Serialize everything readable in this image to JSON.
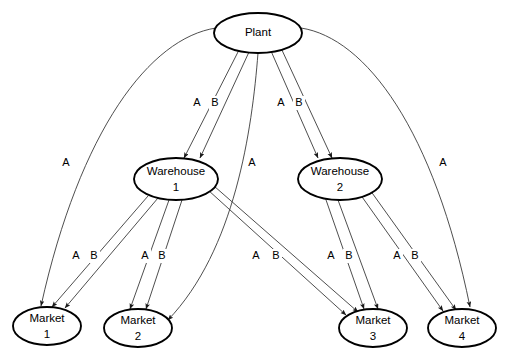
{
  "diagram": {
    "background_color": "#ffffff",
    "node_stroke_color": "#000000",
    "edge_stroke_color": "#3a3a3a",
    "label_color": "#000000"
  },
  "nodes": [
    {
      "id": "plant",
      "line1": "Plant",
      "line2": "",
      "cx": 258,
      "cy": 33,
      "rx": 44,
      "ry": 20
    },
    {
      "id": "warehouse1",
      "line1": "Warehouse",
      "line2": "1",
      "cx": 176,
      "cy": 179,
      "rx": 42,
      "ry": 21
    },
    {
      "id": "warehouse2",
      "line1": "Warehouse",
      "line2": "2",
      "cx": 340,
      "cy": 179,
      "rx": 42,
      "ry": 21
    },
    {
      "id": "market1",
      "line1": "Market",
      "line2": "1",
      "cx": 47,
      "cy": 326,
      "rx": 34,
      "ry": 19
    },
    {
      "id": "market2",
      "line1": "Market",
      "line2": "2",
      "cx": 138,
      "cy": 328,
      "rx": 34,
      "ry": 19
    },
    {
      "id": "market3",
      "line1": "Market",
      "line2": "3",
      "cx": 373,
      "cy": 328,
      "rx": 34,
      "ry": 19
    },
    {
      "id": "market4",
      "line1": "Market",
      "line2": "4",
      "cx": 462,
      "cy": 328,
      "rx": 34,
      "ry": 19
    }
  ],
  "edges": [
    {
      "id": "plant-market1-A",
      "from": "plant",
      "to": "market1",
      "commodity": "A",
      "label_x": 66,
      "label_y": 163,
      "path": "M 216 28 C 150 38 80 130 41 306"
    },
    {
      "id": "plant-warehouse1-A",
      "from": "plant",
      "to": "warehouse1",
      "commodity": "A",
      "label_x": 197,
      "label_y": 103,
      "path": "M 239 50 L 184 158"
    },
    {
      "id": "plant-warehouse1-B",
      "from": "plant",
      "to": "warehouse1",
      "commodity": "B",
      "label_x": 215,
      "label_y": 103,
      "path": "M 249 52 L 200 158"
    },
    {
      "id": "plant-market2-A",
      "from": "plant",
      "to": "market2",
      "commodity": "A",
      "label_x": 252,
      "label_y": 163,
      "path": "M 258 53 C 252 130 235 250 168 320"
    },
    {
      "id": "plant-warehouse2-A",
      "from": "plant",
      "to": "warehouse2",
      "commodity": "A",
      "label_x": 281,
      "label_y": 103,
      "path": "M 271 51 L 318 158"
    },
    {
      "id": "plant-warehouse2-B",
      "from": "plant",
      "to": "warehouse2",
      "commodity": "B",
      "label_x": 299,
      "label_y": 103,
      "path": "M 281 48 L 332 158"
    },
    {
      "id": "plant-market4-A",
      "from": "plant",
      "to": "market4",
      "commodity": "A",
      "label_x": 443,
      "label_y": 163,
      "path": "M 301 28 C 366 38 434 130 470 307"
    },
    {
      "id": "warehouse1-market1-A",
      "from": "warehouse1",
      "to": "market1",
      "commodity": "A",
      "label_x": 76,
      "label_y": 256,
      "path": "M 148 196 L 52 307"
    },
    {
      "id": "warehouse1-market1-B",
      "from": "warehouse1",
      "to": "market1",
      "commodity": "B",
      "label_x": 94,
      "label_y": 256,
      "path": "M 158 198 L 65 308"
    },
    {
      "id": "warehouse1-market2-A",
      "from": "warehouse1",
      "to": "market2",
      "commodity": "A",
      "label_x": 145,
      "label_y": 256,
      "path": "M 169 200 L 130 309"
    },
    {
      "id": "warehouse1-market2-B",
      "from": "warehouse1",
      "to": "market2",
      "commodity": "B",
      "label_x": 162,
      "label_y": 256,
      "path": "M 182 200 L 146 309"
    },
    {
      "id": "warehouse1-market3-A",
      "from": "warehouse1",
      "to": "market3",
      "commodity": "A",
      "label_x": 256,
      "label_y": 256,
      "path": "M 208 190 L 346 315"
    },
    {
      "id": "warehouse1-market3-B",
      "from": "warehouse1",
      "to": "market3",
      "commodity": "B",
      "label_x": 276,
      "label_y": 256,
      "path": "M 214 186 L 358 312"
    },
    {
      "id": "warehouse2-market3-A",
      "from": "warehouse2",
      "to": "market3",
      "commodity": "A",
      "label_x": 331,
      "label_y": 256,
      "path": "M 325 197 L 364 309"
    },
    {
      "id": "warehouse2-market3-B",
      "from": "warehouse2",
      "to": "market3",
      "commodity": "B",
      "label_x": 349,
      "label_y": 256,
      "path": "M 338 200 L 378 309"
    },
    {
      "id": "warehouse2-market4-A",
      "from": "warehouse2",
      "to": "market4",
      "commodity": "A",
      "label_x": 397,
      "label_y": 256,
      "path": "M 360 194 L 443 311"
    },
    {
      "id": "warehouse2-market4-B",
      "from": "warehouse2",
      "to": "market4",
      "commodity": "B",
      "label_x": 415,
      "label_y": 256,
      "path": "M 370 190 L 456 310"
    }
  ]
}
